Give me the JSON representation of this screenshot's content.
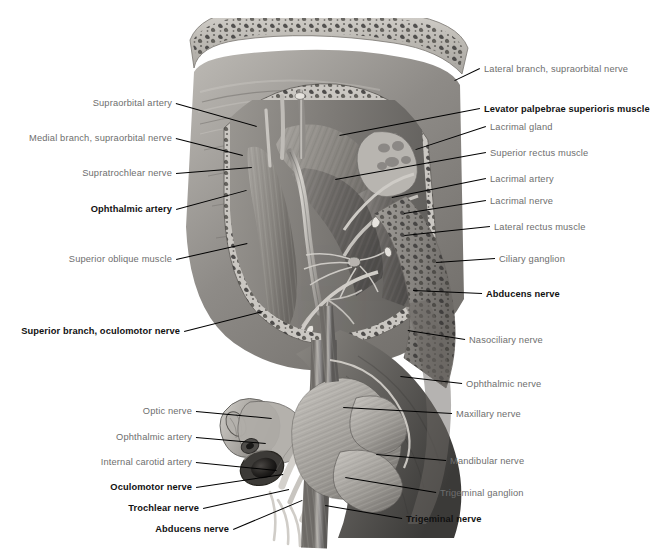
{
  "figure": {
    "kind": "anatomical-illustration",
    "background_color": "#ffffff",
    "label_color": "#6e6e6e",
    "emphasis_label_color": "#111111",
    "leader_color": "#000000"
  },
  "labels_left": [
    {
      "text": "Supraorbital artery",
      "bold": false,
      "x": 172,
      "y": 103,
      "tipx": 257,
      "tipy": 126
    },
    {
      "text": "Medial branch, supraorbital nerve",
      "bold": false,
      "x": 172,
      "y": 138,
      "tipx": 243,
      "tipy": 155
    },
    {
      "text": "Supratrochlear nerve",
      "bold": false,
      "x": 172,
      "y": 173,
      "tipx": 252,
      "tipy": 167
    },
    {
      "text": "Ophthalmic artery",
      "bold": true,
      "x": 172,
      "y": 209,
      "tipx": 246,
      "tipy": 190
    },
    {
      "text": "Superior oblique muscle",
      "bold": false,
      "x": 172,
      "y": 259,
      "tipx": 247,
      "tipy": 243
    },
    {
      "text": "Superior branch, oculomotor nerve",
      "bold": true,
      "x": 180,
      "y": 331,
      "tipx": 263,
      "tipy": 311
    },
    {
      "text": "Optic nerve",
      "bold": false,
      "x": 192,
      "y": 411,
      "tipx": 272,
      "tipy": 418
    },
    {
      "text": "Ophthalmic artery",
      "bold": false,
      "x": 192,
      "y": 437,
      "tipx": 266,
      "tipy": 443
    },
    {
      "text": "Internal carotid artery",
      "bold": false,
      "x": 192,
      "y": 462,
      "tipx": 277,
      "tipy": 470
    },
    {
      "text": "Oculomotor nerve",
      "bold": true,
      "x": 192,
      "y": 487,
      "tipx": 283,
      "tipy": 474
    },
    {
      "text": "Trochlear nerve",
      "bold": true,
      "x": 199,
      "y": 508,
      "tipx": 289,
      "tipy": 489
    },
    {
      "text": "Abducens nerve",
      "bold": true,
      "x": 229,
      "y": 529,
      "tipx": 302,
      "tipy": 500
    }
  ],
  "labels_right": [
    {
      "text": "Lateral branch, supraorbital nerve",
      "bold": false,
      "x": 484,
      "y": 69,
      "tipx": 455,
      "tipy": 81
    },
    {
      "text": "Levator palpebrae superioris muscle",
      "bold": true,
      "x": 484,
      "y": 109,
      "tipx": 340,
      "tipy": 136
    },
    {
      "text": "Lacrimal gland",
      "bold": false,
      "x": 490,
      "y": 127,
      "tipx": 416,
      "tipy": 150
    },
    {
      "text": "Superior rectus muscle",
      "bold": false,
      "x": 490,
      "y": 153,
      "tipx": 335,
      "tipy": 180
    },
    {
      "text": "Lacrimal artery",
      "bold": false,
      "x": 490,
      "y": 179,
      "tipx": 392,
      "tipy": 198
    },
    {
      "text": "Lacrimal nerve",
      "bold": false,
      "x": 490,
      "y": 201,
      "tipx": 404,
      "tipy": 214
    },
    {
      "text": "Lateral rectus muscle",
      "bold": false,
      "x": 494,
      "y": 227,
      "tipx": 404,
      "tipy": 236
    },
    {
      "text": "Ciliary ganglion",
      "bold": false,
      "x": 499,
      "y": 259,
      "tipx": 436,
      "tipy": 263
    },
    {
      "text": "Abducens nerve",
      "bold": true,
      "x": 486,
      "y": 294,
      "tipx": 413,
      "tipy": 291
    },
    {
      "text": "Nasociliary nerve",
      "bold": false,
      "x": 469,
      "y": 340,
      "tipx": 408,
      "tipy": 331
    },
    {
      "text": "Ophthalmic nerve",
      "bold": false,
      "x": 466,
      "y": 384,
      "tipx": 400,
      "tipy": 377
    },
    {
      "text": "Maxillary nerve",
      "bold": false,
      "x": 456,
      "y": 414,
      "tipx": 343,
      "tipy": 408
    },
    {
      "text": "Mandibular nerve",
      "bold": false,
      "x": 450,
      "y": 461,
      "tipx": 376,
      "tipy": 455
    },
    {
      "text": "Trigeminal ganglion",
      "bold": false,
      "x": 440,
      "y": 493,
      "tipx": 345,
      "tipy": 478
    },
    {
      "text": "Trigeminal nerve",
      "bold": true,
      "x": 406,
      "y": 519,
      "tipx": 325,
      "tipy": 506
    }
  ]
}
